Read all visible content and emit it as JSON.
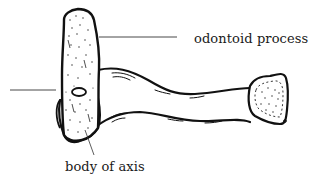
{
  "diagram": {
    "labels": {
      "odontoid": "odontoid process",
      "body": "body of axis",
      "left_pointer": ""
    },
    "colors": {
      "ink": "#111111",
      "label_line": "#333333",
      "background": "#ffffff"
    }
  }
}
